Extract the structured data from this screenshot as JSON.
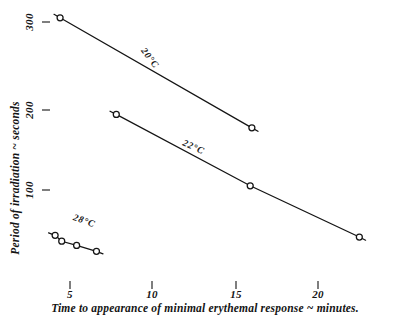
{
  "chart_data": {
    "type": "line",
    "title": "",
    "subtitle": "",
    "xlabel": "Time to appearance of minimal erythemal response ~ minutes.",
    "ylabel": "Period of irradiation ~ seconds",
    "xlim": [
      0,
      24
    ],
    "ylim": [
      0,
      320
    ],
    "xticks": [
      5,
      10,
      15,
      20
    ],
    "xtick_labels": [
      "5",
      "10",
      "15",
      "20"
    ],
    "yticks": [
      100,
      200,
      300
    ],
    "ytick_labels": [
      "100",
      "200",
      "300"
    ],
    "grid": false,
    "legend_position": "inline-annotations",
    "marker": "open-circle",
    "series": [
      {
        "name": "20°C",
        "label": "20°C",
        "x": [
          4.4,
          16.0
        ],
        "y": [
          305,
          174
        ]
      },
      {
        "name": "22°C",
        "label": "22°C",
        "x": [
          7.8,
          15.9,
          22.5
        ],
        "y": [
          190,
          105,
          44
        ]
      },
      {
        "name": "28°C",
        "label": "28°C",
        "x": [
          4.1,
          4.5,
          5.4,
          6.6
        ],
        "y": [
          46,
          39,
          34,
          27
        ]
      }
    ],
    "annotations": [
      {
        "text": "20°C",
        "x": 9.7,
        "y": 255,
        "rotation": 52
      },
      {
        "text": "22°C",
        "x": 12.4,
        "y": 148,
        "rotation": 24
      },
      {
        "text": "28°C",
        "x": 5.8,
        "y": 60,
        "rotation": 20
      }
    ]
  },
  "axes": {
    "x_title": "Time to appearance of minimal erythemal response ~ minutes.",
    "y_title": "Period of irradiation ~ seconds",
    "x_tick_5": "5",
    "x_tick_10": "10",
    "x_tick_15": "15",
    "x_tick_20": "20",
    "y_tick_100": "100",
    "y_tick_200": "200",
    "y_tick_300": "300"
  },
  "series_labels": {
    "s20": "20°C",
    "s22": "22°C",
    "s28": "28°C"
  },
  "colors": {
    "ink": "#141414",
    "paper": "#ffffff"
  }
}
